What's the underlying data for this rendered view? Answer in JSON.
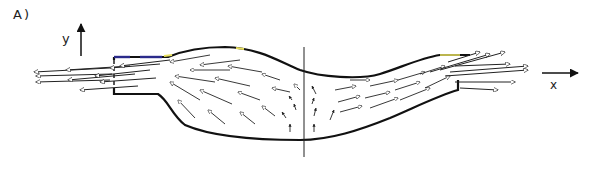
{
  "figure": {
    "panel_label": "A)",
    "axes": {
      "y_label": "y",
      "x_label": "x"
    },
    "colors": {
      "line": "#111111",
      "arrow": "#222222",
      "background": "#ffffff",
      "edge_highlight_blue": "#2a2a8a",
      "edge_highlight_yellow": "#e8e060"
    }
  }
}
